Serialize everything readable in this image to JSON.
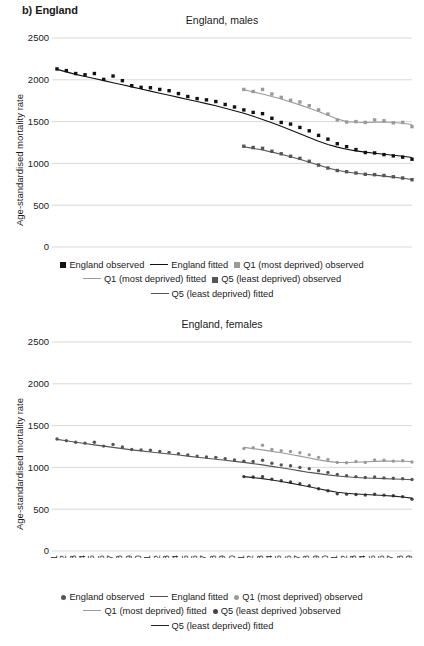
{
  "panel": {
    "label": "b) England"
  },
  "colors": {
    "england": "#111111",
    "q1_most_deprived": "#9a9a9a",
    "q5_least_deprived": "#555555",
    "grid": "#c8c8c8",
    "text": "#1a1a1a"
  },
  "axis": {
    "y_label": "Age-standardised mortality rate",
    "y_ticks": [
      0,
      500,
      1000,
      1500,
      2000,
      2500
    ],
    "y_min": 0,
    "y_max": 2500,
    "x_ticks": [
      "1981",
      "1982",
      "1983",
      "1984",
      "1985",
      "1986",
      "1987",
      "1988",
      "1989",
      "1990",
      "1991",
      "1992",
      "1993",
      "1994",
      "1995",
      "1996",
      "1997",
      "1998",
      "1999",
      "2000",
      "2001",
      "2002",
      "2003",
      "2004",
      "2005",
      "2006",
      "2007",
      "2008",
      "2009",
      "2010",
      "2011",
      "2012",
      "2013",
      "2014",
      "2015",
      "2016",
      "2017",
      "2018",
      "2019"
    ],
    "x_min": 1981,
    "x_max": 2019
  },
  "legend_males": {
    "rows": [
      [
        {
          "marker": "square",
          "color": "#111111",
          "label": "England observed"
        },
        {
          "marker": "line",
          "color": "#111111",
          "label": "England fitted"
        },
        {
          "marker": "square",
          "color": "#9a9a9a",
          "label": "Q1 (most deprived) observed"
        }
      ],
      [
        {
          "marker": "line",
          "color": "#9a9a9a",
          "label": "Q1 (most deprived) fitted"
        },
        {
          "marker": "square",
          "color": "#555555",
          "label": "Q5 (least deprived) observed"
        }
      ],
      [
        {
          "marker": "line",
          "color": "#555555",
          "label": "Q5 (least deprived) fitted"
        }
      ]
    ]
  },
  "legend_females": {
    "rows": [
      [
        {
          "marker": "circle",
          "color": "#555555",
          "label": "England observed"
        },
        {
          "marker": "line",
          "color": "#555555",
          "label": "England fitted"
        },
        {
          "marker": "circle",
          "color": "#9a9a9a",
          "label": "Q1 (most deprived) observed"
        }
      ],
      [
        {
          "marker": "line",
          "color": "#9a9a9a",
          "label": "Q1 (most deprived) fitted"
        },
        {
          "marker": "circle",
          "color": "#444444",
          "label": "Q5 (least deprived )observed"
        }
      ],
      [
        {
          "marker": "line",
          "color": "#222222",
          "label": "Q5 (least deprived) fitted"
        }
      ]
    ]
  },
  "chart_data": [
    {
      "type": "scatter",
      "id": "england-males",
      "title": "England, males",
      "xlabel": "",
      "ylabel": "Age-standardised mortality rate",
      "ylim": [
        0,
        2500
      ],
      "xlim": [
        1981,
        2019
      ],
      "grid": true,
      "legend_position": "below",
      "x": [
        1981,
        1982,
        1983,
        1984,
        1985,
        1986,
        1987,
        1988,
        1989,
        1990,
        1991,
        1992,
        1993,
        1994,
        1995,
        1996,
        1997,
        1998,
        1999,
        2000,
        2001,
        2002,
        2003,
        2004,
        2005,
        2006,
        2007,
        2008,
        2009,
        2010,
        2011,
        2012,
        2013,
        2014,
        2015,
        2016,
        2017,
        2018,
        2019
      ],
      "series": [
        {
          "name": "England observed",
          "marker": "square",
          "color": "#111111",
          "values": [
            2130,
            2110,
            2075,
            2060,
            2075,
            2005,
            2045,
            1990,
            1930,
            1910,
            1905,
            1885,
            1870,
            1835,
            1800,
            1775,
            1760,
            1740,
            1705,
            1675,
            1640,
            1610,
            1595,
            1540,
            1490,
            1470,
            1430,
            1390,
            1335,
            1290,
            1235,
            1200,
            1165,
            1130,
            1125,
            1105,
            1090,
            1075,
            1050
          ]
        },
        {
          "name": "England fitted",
          "marker": "line",
          "color": "#111111",
          "values": [
            2125,
            2095,
            2065,
            2040,
            2015,
            1990,
            1965,
            1940,
            1915,
            1890,
            1865,
            1840,
            1815,
            1790,
            1765,
            1740,
            1715,
            1690,
            1660,
            1630,
            1600,
            1565,
            1525,
            1485,
            1445,
            1400,
            1355,
            1310,
            1265,
            1225,
            1195,
            1170,
            1150,
            1135,
            1122,
            1110,
            1098,
            1085,
            1070
          ]
        },
        {
          "name": "Q1 (most deprived) observed",
          "marker": "square",
          "color": "#9a9a9a",
          "values": [
            null,
            null,
            null,
            null,
            null,
            null,
            null,
            null,
            null,
            null,
            null,
            null,
            null,
            null,
            null,
            null,
            null,
            null,
            null,
            null,
            1885,
            1860,
            1885,
            1830,
            1790,
            1755,
            1735,
            1690,
            1640,
            1590,
            1520,
            1495,
            1500,
            1490,
            1520,
            1510,
            1485,
            1490,
            1440
          ]
        },
        {
          "name": "Q1 (most deprived) fitted",
          "marker": "line",
          "color": "#9a9a9a",
          "values": [
            null,
            null,
            null,
            null,
            null,
            null,
            null,
            null,
            null,
            null,
            null,
            null,
            null,
            null,
            null,
            null,
            null,
            null,
            null,
            null,
            1880,
            1855,
            1830,
            1800,
            1770,
            1735,
            1700,
            1660,
            1620,
            1575,
            1530,
            1500,
            1492,
            1490,
            1492,
            1495,
            1490,
            1480,
            1465
          ]
        },
        {
          "name": "Q5 (least deprived) observed",
          "marker": "square",
          "color": "#555555",
          "values": [
            null,
            null,
            null,
            null,
            null,
            null,
            null,
            null,
            null,
            null,
            null,
            null,
            null,
            null,
            null,
            null,
            null,
            null,
            null,
            null,
            1205,
            1190,
            1180,
            1145,
            1115,
            1085,
            1060,
            1025,
            980,
            945,
            915,
            900,
            885,
            870,
            865,
            855,
            840,
            825,
            805
          ]
        },
        {
          "name": "Q5 (least deprived) fitted",
          "marker": "line",
          "color": "#555555",
          "values": [
            null,
            null,
            null,
            null,
            null,
            null,
            null,
            null,
            null,
            null,
            null,
            null,
            null,
            null,
            null,
            null,
            null,
            null,
            null,
            null,
            1200,
            1180,
            1160,
            1135,
            1110,
            1080,
            1050,
            1015,
            980,
            945,
            918,
            898,
            882,
            870,
            860,
            848,
            836,
            822,
            808
          ]
        }
      ]
    },
    {
      "type": "scatter",
      "id": "england-females",
      "title": "England, females",
      "xlabel": "",
      "ylabel": "Age-standardised mortality rate",
      "ylim": [
        0,
        2500
      ],
      "xlim": [
        1981,
        2019
      ],
      "grid": true,
      "legend_position": "below",
      "x": [
        1981,
        1982,
        1983,
        1984,
        1985,
        1986,
        1987,
        1988,
        1989,
        1990,
        1991,
        1992,
        1993,
        1994,
        1995,
        1996,
        1997,
        1998,
        1999,
        2000,
        2001,
        2002,
        2003,
        2004,
        2005,
        2006,
        2007,
        2008,
        2009,
        2010,
        2011,
        2012,
        2013,
        2014,
        2015,
        2016,
        2017,
        2018,
        2019
      ],
      "series": [
        {
          "name": "England observed",
          "marker": "circle",
          "color": "#555555",
          "values": [
            1340,
            1320,
            1300,
            1290,
            1300,
            1255,
            1275,
            1245,
            1215,
            1210,
            1205,
            1190,
            1180,
            1165,
            1150,
            1135,
            1125,
            1120,
            1105,
            1090,
            1075,
            1070,
            1085,
            1050,
            1030,
            1020,
            1000,
            985,
            960,
            940,
            915,
            900,
            890,
            880,
            885,
            875,
            870,
            865,
            855
          ]
        },
        {
          "name": "England fitted",
          "marker": "line",
          "color": "#555555",
          "values": [
            1335,
            1318,
            1300,
            1285,
            1270,
            1255,
            1240,
            1225,
            1210,
            1198,
            1185,
            1172,
            1160,
            1148,
            1135,
            1122,
            1110,
            1098,
            1085,
            1072,
            1060,
            1045,
            1030,
            1012,
            995,
            978,
            958,
            940,
            925,
            910,
            898,
            888,
            880,
            874,
            870,
            866,
            862,
            858,
            852
          ]
        },
        {
          "name": "Q1 (most deprived) observed",
          "marker": "circle",
          "color": "#9a9a9a",
          "values": [
            null,
            null,
            null,
            null,
            null,
            null,
            null,
            null,
            null,
            null,
            null,
            null,
            null,
            null,
            null,
            null,
            null,
            null,
            null,
            null,
            1225,
            1235,
            1265,
            1215,
            1200,
            1190,
            1175,
            1150,
            1120,
            1095,
            1060,
            1055,
            1070,
            1060,
            1090,
            1085,
            1075,
            1080,
            1065
          ]
        },
        {
          "name": "Q1 (most deprived) fitted",
          "marker": "line",
          "color": "#9a9a9a",
          "values": [
            null,
            null,
            null,
            null,
            null,
            null,
            null,
            null,
            null,
            null,
            null,
            null,
            null,
            null,
            null,
            null,
            null,
            null,
            null,
            null,
            1240,
            1225,
            1210,
            1192,
            1175,
            1155,
            1135,
            1112,
            1090,
            1072,
            1060,
            1058,
            1062,
            1068,
            1072,
            1075,
            1076,
            1074,
            1070
          ]
        },
        {
          "name": "Q5 (least deprived) observed",
          "marker": "circle",
          "color": "#444444",
          "values": [
            null,
            null,
            null,
            null,
            null,
            null,
            null,
            null,
            null,
            null,
            null,
            null,
            null,
            null,
            null,
            null,
            null,
            null,
            null,
            null,
            890,
            885,
            890,
            860,
            840,
            825,
            805,
            780,
            745,
            720,
            685,
            680,
            675,
            670,
            680,
            668,
            660,
            650,
            620
          ]
        },
        {
          "name": "Q5 (least deprived) fitted",
          "marker": "line",
          "color": "#222222",
          "values": [
            null,
            null,
            null,
            null,
            null,
            null,
            null,
            null,
            null,
            null,
            null,
            null,
            null,
            null,
            null,
            null,
            null,
            null,
            null,
            null,
            890,
            878,
            866,
            850,
            832,
            812,
            790,
            768,
            745,
            722,
            702,
            690,
            682,
            675,
            670,
            664,
            656,
            646,
            632
          ]
        }
      ]
    }
  ]
}
